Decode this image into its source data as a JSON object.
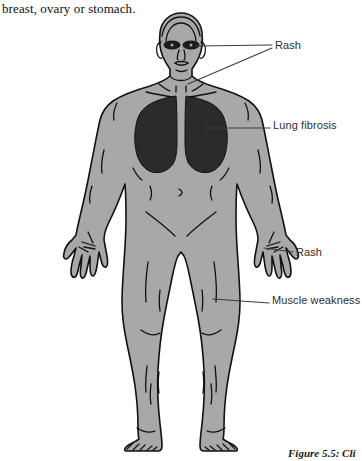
{
  "page": {
    "background_color": "#ffffff",
    "width": 362,
    "height": 461
  },
  "body_text": {
    "text": "breast, ovary or stomach."
  },
  "figure": {
    "caption": "Figure 5.5: Cli",
    "colors": {
      "skin_fill": "#a8a8a8",
      "outline": "#111111",
      "organ_fill": "#2b2b2b",
      "leader_line": "#3c3c3c",
      "label_text": "#2e2e2e"
    },
    "regions": [
      {
        "name": "heliotrope-eye-rash",
        "fill": "#1e1e1e"
      },
      {
        "name": "lung-fibrosis-shading",
        "fill": "#2b2b2b"
      }
    ],
    "annotations": [
      {
        "id": "rash-face",
        "label": "Rash",
        "target": "face and upper chest"
      },
      {
        "id": "lung-fibrosis",
        "label": "Lung fibrosis",
        "target": "lungs"
      },
      {
        "id": "rash-hand",
        "label": "Rash",
        "target": "right hand knuckles"
      },
      {
        "id": "muscle-weakness",
        "label": "Muscle weakness",
        "target": "right thigh"
      }
    ]
  }
}
